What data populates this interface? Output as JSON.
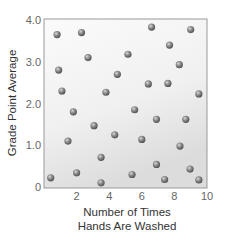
{
  "chart_data": {
    "type": "scatter",
    "title": "",
    "xlabel": [
      "Number of Times",
      "Hands Are Washed"
    ],
    "ylabel": "Grade Point Average",
    "xlim": [
      0,
      10
    ],
    "ylim": [
      0,
      4.0
    ],
    "x_ticks": [
      {
        "v": 2,
        "label": "2"
      },
      {
        "v": 4,
        "label": "4"
      },
      {
        "v": 6,
        "label": "6"
      },
      {
        "v": 8,
        "label": "8"
      },
      {
        "v": 10,
        "label": "10"
      }
    ],
    "y_ticks": [
      {
        "v": 0,
        "label": "0"
      },
      {
        "v": 1,
        "label": "1.0"
      },
      {
        "v": 2,
        "label": "2.0"
      },
      {
        "v": 3,
        "label": "3.0"
      },
      {
        "v": 4,
        "label": "4.0"
      }
    ],
    "grid": false,
    "legend": null,
    "marker_color": "#7a7a7a",
    "points": [
      {
        "x": 0.8,
        "y": 3.65
      },
      {
        "x": 2.3,
        "y": 3.7
      },
      {
        "x": 2.7,
        "y": 3.1
      },
      {
        "x": 0.9,
        "y": 2.8
      },
      {
        "x": 4.5,
        "y": 2.7
      },
      {
        "x": 1.1,
        "y": 2.3
      },
      {
        "x": 3.8,
        "y": 2.27
      },
      {
        "x": 6.6,
        "y": 3.83
      },
      {
        "x": 9.0,
        "y": 3.77
      },
      {
        "x": 7.7,
        "y": 3.4
      },
      {
        "x": 5.15,
        "y": 3.18
      },
      {
        "x": 8.3,
        "y": 2.93
      },
      {
        "x": 6.4,
        "y": 2.47
      },
      {
        "x": 7.6,
        "y": 2.48
      },
      {
        "x": 9.5,
        "y": 2.23
      },
      {
        "x": 1.8,
        "y": 1.8
      },
      {
        "x": 3.07,
        "y": 1.47
      },
      {
        "x": 4.34,
        "y": 1.25
      },
      {
        "x": 1.47,
        "y": 1.1
      },
      {
        "x": 3.5,
        "y": 0.71
      },
      {
        "x": 2.0,
        "y": 0.34
      },
      {
        "x": 0.41,
        "y": 0.22
      },
      {
        "x": 3.5,
        "y": 0.1
      },
      {
        "x": 5.56,
        "y": 1.85
      },
      {
        "x": 6.9,
        "y": 1.62
      },
      {
        "x": 8.7,
        "y": 1.62
      },
      {
        "x": 6.0,
        "y": 1.14
      },
      {
        "x": 8.34,
        "y": 0.98
      },
      {
        "x": 6.9,
        "y": 0.54
      },
      {
        "x": 8.96,
        "y": 0.43
      },
      {
        "x": 5.4,
        "y": 0.3
      },
      {
        "x": 7.4,
        "y": 0.18
      },
      {
        "x": 9.5,
        "y": 0.17
      }
    ]
  }
}
